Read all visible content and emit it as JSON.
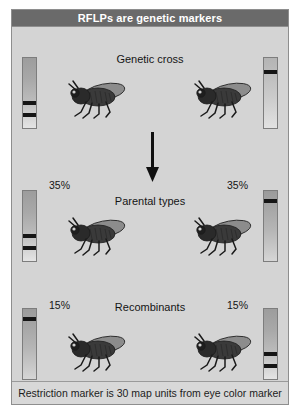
{
  "figure": {
    "title": "RFLPs are genetic markers",
    "caption": "Restriction marker is 30 map units from eye color marker",
    "accent_dark": "#6a6a6a",
    "panel_bg": "#d4d4d4",
    "band_color": "#151515"
  },
  "rows": [
    {
      "id": "genetic-cross",
      "stage_label": "Genetic cross",
      "left_percent": "",
      "right_percent": "",
      "left_lane_bands": 2,
      "right_lane_bands": 1
    },
    {
      "id": "parental-types",
      "stage_label": "Parental types",
      "left_percent": "35%",
      "right_percent": "35%",
      "left_lane_bands": 2,
      "right_lane_bands": 1
    },
    {
      "id": "recombinants",
      "stage_label": "Recombinants",
      "left_percent": "15%",
      "right_percent": "15%",
      "left_lane_bands": 1,
      "right_lane_bands": 2
    }
  ],
  "arrow": {
    "name": "downward-arrow",
    "direction": "down"
  },
  "organism": {
    "name": "drosophila-fly",
    "count_visible": 6
  }
}
